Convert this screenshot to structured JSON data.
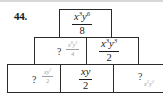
{
  "problem": {
    "number_label": "44."
  },
  "pyramid": {
    "top": {
      "numerator": {
        "base1": "x",
        "exp1": "3",
        "base2": "y",
        "exp2": "6"
      },
      "denominator": "8"
    },
    "middle": [
      {
        "question": "?",
        "hint_numerator": {
          "base1": "x",
          "exp1": "0",
          "base2": "y",
          "exp2": "3"
        },
        "hint_denominator": "4"
      },
      {
        "numerator": {
          "base1": "x",
          "exp1": "3",
          "base2": "y",
          "exp2": "3"
        },
        "denominator": "2"
      }
    ],
    "bottom": [
      {
        "question": "?",
        "hint_numerator": {
          "base1": "xy",
          "exp1": "",
          "base2": "",
          "exp2": "2"
        },
        "hint_denominator": "2"
      },
      {
        "numerator": {
          "base1": "xy",
          "exp1": "",
          "base2": "",
          "exp2": ""
        },
        "denominator": "2"
      },
      {
        "question": "?",
        "hint": {
          "base1": "x",
          "exp1": "2",
          "base2": "y",
          "exp2": "2"
        }
      }
    ]
  },
  "colors": {
    "border": "#2a2a2a",
    "text": "#1a1a1a",
    "hint_text": "#9a9a9a"
  }
}
